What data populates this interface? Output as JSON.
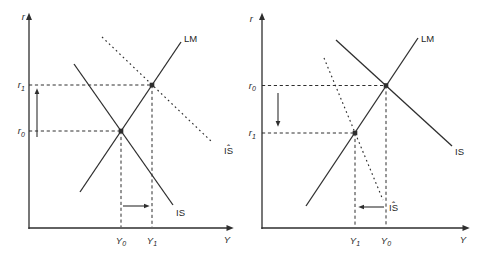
{
  "colors": {
    "background": "#ffffff",
    "line": "#2e2e2e",
    "text": "#1f1f1f"
  },
  "left_panel": {
    "y_axis_label": "r",
    "x_axis_label": "Y",
    "lm_label": "LM",
    "is_label": "IS",
    "is_shifted": {
      "hat": "ˆ",
      "base": "IS"
    },
    "y_ticks": {
      "upper": {
        "base": "r",
        "sub": "1"
      },
      "lower": {
        "base": "r",
        "sub": "0"
      }
    },
    "x_ticks": {
      "left": {
        "base": "Y",
        "sub": "0"
      },
      "right": {
        "base": "Y",
        "sub": "1"
      }
    }
  },
  "right_panel": {
    "y_axis_label": "r",
    "x_axis_label": "Y",
    "lm_label": "LM",
    "is_label": "IS",
    "is_shifted": {
      "hat": "ˆ",
      "base": "IS"
    },
    "y_ticks": {
      "upper": {
        "base": "r",
        "sub": "0"
      },
      "lower": {
        "base": "r",
        "sub": "1"
      }
    },
    "x_ticks": {
      "left": {
        "base": "Y",
        "sub": "1"
      },
      "right": {
        "base": "Y",
        "sub": "0"
      }
    }
  }
}
